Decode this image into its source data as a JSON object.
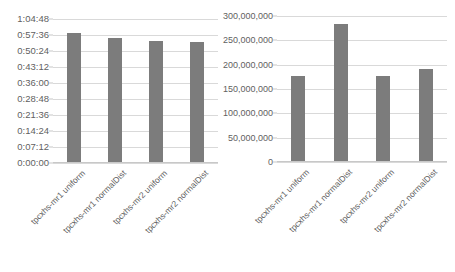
{
  "chart_data": [
    {
      "name": "execution-time-chart",
      "type": "bar",
      "title": "",
      "xlabel": "",
      "ylabel": "",
      "categories": [
        "tpcxhs-mr1 uniform",
        "tpcxhs-mr1 normalDist",
        "tpcxhs-mr2 uniform",
        "tpcxhs-mr2 normalDist"
      ],
      "values": [
        "0:58:30",
        "0:56:15",
        "0:54:54",
        "0:54:27"
      ],
      "values_seconds": [
        3510,
        3375,
        3294,
        3267
      ],
      "ytick_labels": [
        "1:04:48",
        "0:57:36",
        "0:50:24",
        "0:43:12",
        "0:36:00",
        "0:28:48",
        "0:21:36",
        "0:14:24",
        "0:07:12",
        "0:00:00"
      ],
      "ytick_seconds": [
        3888,
        3456,
        3024,
        2592,
        2160,
        1728,
        1296,
        864,
        432,
        0
      ],
      "ylim_seconds": [
        0,
        3888
      ],
      "grid": true,
      "legend": "none",
      "bar_color": "#7c7c7c",
      "grid_color": "#d9d9d9"
    },
    {
      "name": "throughput-chart",
      "type": "bar",
      "title": "",
      "xlabel": "",
      "ylabel": "",
      "categories": [
        "tpcxhs-mr1 uniform",
        "tpcxhs-mr1 normalDist",
        "tpcxhs-mr2 uniform",
        "tpcxhs-mr2 normalDist"
      ],
      "values": [
        177000000,
        283000000,
        177000000,
        191000000
      ],
      "ytick_labels": [
        "300,000,000",
        "250,000,000",
        "200,000,000",
        "150,000,000",
        "100,000,000",
        "50,000,000",
        "0"
      ],
      "ytick_values": [
        300000000,
        250000000,
        200000000,
        150000000,
        100000000,
        50000000,
        0
      ],
      "ylim": [
        0,
        300000000
      ],
      "grid": true,
      "legend": "none",
      "bar_color": "#7c7c7c",
      "grid_color": "#d9d9d9"
    }
  ]
}
